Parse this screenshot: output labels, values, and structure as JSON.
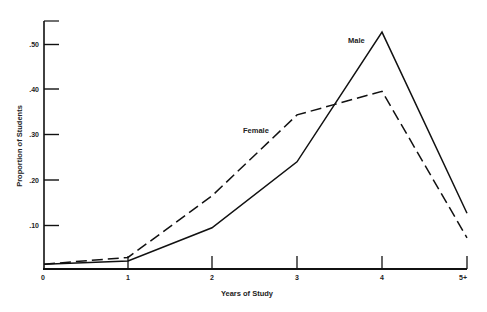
{
  "chart_data": {
    "type": "line",
    "title": "",
    "xlabel": "Years of Study",
    "ylabel": "Proportion of Students",
    "categories": [
      "0",
      "1",
      "2",
      "3",
      "4",
      "5+"
    ],
    "y_ticks": [
      ".10",
      ".20",
      ".30",
      ".40",
      ".50"
    ],
    "y_tick_values": [
      0.1,
      0.2,
      0.3,
      0.4,
      0.5
    ],
    "ylim": [
      0,
      0.55
    ],
    "grid": false,
    "legend": "inline labels",
    "series": [
      {
        "name": "Male",
        "style": "solid",
        "values": [
          0.015,
          0.022,
          0.095,
          0.24,
          0.525,
          0.127
        ]
      },
      {
        "name": "Female",
        "style": "dashed",
        "values": [
          0.015,
          0.03,
          0.165,
          0.343,
          0.395,
          0.073
        ]
      }
    ]
  }
}
